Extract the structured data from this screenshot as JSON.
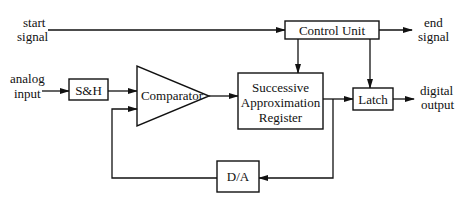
{
  "diagram": {
    "blocks": {
      "control_unit": "Control Unit",
      "sample_hold": "S&H",
      "comparator": "Comparator",
      "sar_line1": "Successive",
      "sar_line2": "Approximation",
      "sar_line3": "Register",
      "latch": "Latch",
      "dac": "D/A"
    },
    "signals": {
      "start_line1": "start",
      "start_line2": "signal",
      "end_line1": "end",
      "end_line2": "signal",
      "analog_line1": "analog",
      "analog_line2": "input",
      "digital_line1": "digital",
      "digital_line2": "output"
    },
    "edges": [
      {
        "from": "start signal",
        "to": "Control Unit"
      },
      {
        "from": "Control Unit",
        "to": "end signal"
      },
      {
        "from": "Control Unit",
        "to": "Successive Approximation Register"
      },
      {
        "from": "Control Unit",
        "to": "Latch"
      },
      {
        "from": "analog input",
        "to": "S&H"
      },
      {
        "from": "S&H",
        "to": "Comparator"
      },
      {
        "from": "Comparator",
        "to": "Successive Approximation Register"
      },
      {
        "from": "Successive Approximation Register",
        "to": "Latch"
      },
      {
        "from": "Latch",
        "to": "digital output"
      },
      {
        "from": "Successive Approximation Register",
        "to": "D/A"
      },
      {
        "from": "D/A",
        "to": "Comparator"
      }
    ],
    "colors": {
      "stroke": "#111111",
      "background": "#ffffff"
    }
  }
}
